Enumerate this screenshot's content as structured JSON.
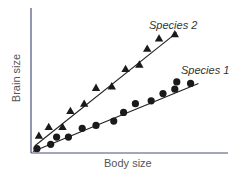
{
  "chart_data": {
    "type": "scatter",
    "title": "",
    "xlabel": "Body size",
    "ylabel": "Brain size",
    "xlim": [
      0,
      100
    ],
    "ylim": [
      0,
      100
    ],
    "grid": false,
    "axis_ticks": false,
    "legend_position": "inline labels at end of fit lines",
    "series": [
      {
        "name": "Species 2",
        "marker": "triangle",
        "points": [
          [
            4,
            12
          ],
          [
            9,
            18
          ],
          [
            16,
            18
          ],
          [
            20,
            29
          ],
          [
            27,
            34
          ],
          [
            33,
            45
          ],
          [
            41,
            46
          ],
          [
            48,
            58
          ],
          [
            55,
            61
          ],
          [
            59,
            72
          ],
          [
            65,
            79
          ],
          [
            73,
            82
          ]
        ],
        "fit_line": [
          [
            2,
            5
          ],
          [
            74,
            83
          ]
        ]
      },
      {
        "name": "Species 1",
        "marker": "circle",
        "points": [
          [
            3,
            3
          ],
          [
            10,
            6
          ],
          [
            13,
            11
          ],
          [
            19,
            11
          ],
          [
            26,
            17
          ],
          [
            33,
            19
          ],
          [
            42,
            22
          ],
          [
            47,
            28
          ],
          [
            53,
            34
          ],
          [
            61,
            36
          ],
          [
            67,
            41
          ],
          [
            73,
            44
          ],
          [
            74,
            49
          ],
          [
            81,
            48
          ]
        ],
        "fit_line": [
          [
            1,
            1
          ],
          [
            85,
            48
          ]
        ]
      }
    ],
    "annotations": [
      "Species 2",
      "Species 1"
    ]
  },
  "labels": {
    "x_axis": "Body size",
    "y_axis": "Brain size",
    "species2": "Species 2",
    "species1": "Species 1"
  },
  "colors": {
    "axis": "#4a4f7a",
    "marker": "#1a1a1a",
    "line": "#222222",
    "text": "#555555"
  }
}
